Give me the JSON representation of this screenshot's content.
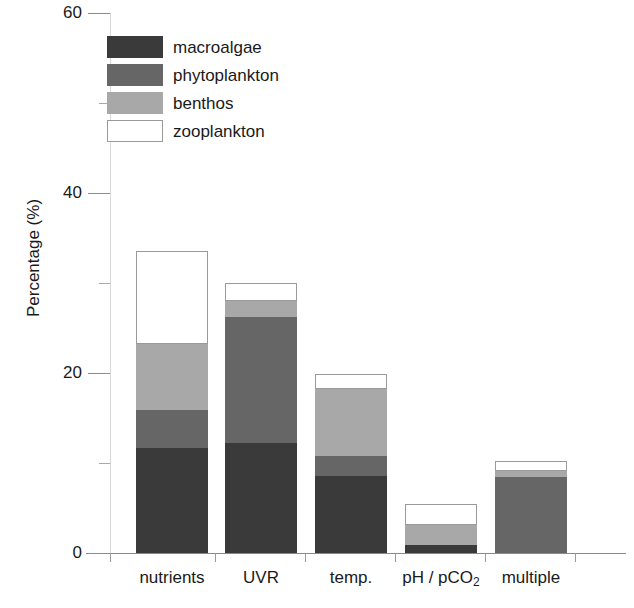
{
  "chart_data": {
    "type": "bar",
    "subtype": "stacked-bar",
    "title": "",
    "xlabel": "",
    "ylabel": "Percentage (%)",
    "ylim": [
      0,
      60
    ],
    "ytick_major": [
      0,
      20,
      40,
      60
    ],
    "ytick_minor": [
      10,
      30,
      50
    ],
    "ytick_labels": [
      "0",
      "20",
      "40",
      "60"
    ],
    "grid": false,
    "legend_position": "upper-left-inside",
    "categories": [
      "nutrients",
      "UVR",
      "temp.",
      "pH / pCO2",
      "multiple"
    ],
    "category_labels_html": [
      "nutrients",
      "UVR",
      "temp.",
      "pH / pCO<sub>2</sub>",
      "multiple"
    ],
    "series": [
      {
        "name": "macroalgae",
        "color": "#3a3a3a",
        "values": [
          11.7,
          12.2,
          8.6,
          0.9,
          0.0
        ]
      },
      {
        "name": "phytoplankton",
        "color": "#666666",
        "values": [
          4.2,
          14.0,
          2.2,
          0.0,
          8.4
        ]
      },
      {
        "name": "benthos",
        "color": "#a8a8a8",
        "values": [
          7.3,
          1.8,
          7.4,
          2.2,
          0.7
        ]
      },
      {
        "name": "zooplankton",
        "color": "#ffffff",
        "values": [
          10.4,
          2.0,
          1.7,
          2.4,
          1.1
        ]
      }
    ],
    "totals": [
      33.6,
      30.0,
      19.9,
      5.5,
      10.2
    ],
    "stack_order_bottom_to_top": [
      "macroalgae",
      "phytoplankton",
      "benthos",
      "zooplankton"
    ]
  },
  "legend": {
    "items": [
      {
        "label": "macroalgae",
        "swatch": "dark-gray-swatch"
      },
      {
        "label": "phytoplankton",
        "swatch": "medium-gray-swatch"
      },
      {
        "label": "benthos",
        "swatch": "light-gray-swatch"
      },
      {
        "label": "zooplankton",
        "swatch": "white-swatch"
      }
    ]
  },
  "colors": {
    "macroalgae": "#3a3a3a",
    "phytoplankton": "#666666",
    "benthos": "#a8a8a8",
    "zooplankton": "#ffffff",
    "axis": "#8a8a8a",
    "text": "#1a1a1a"
  }
}
